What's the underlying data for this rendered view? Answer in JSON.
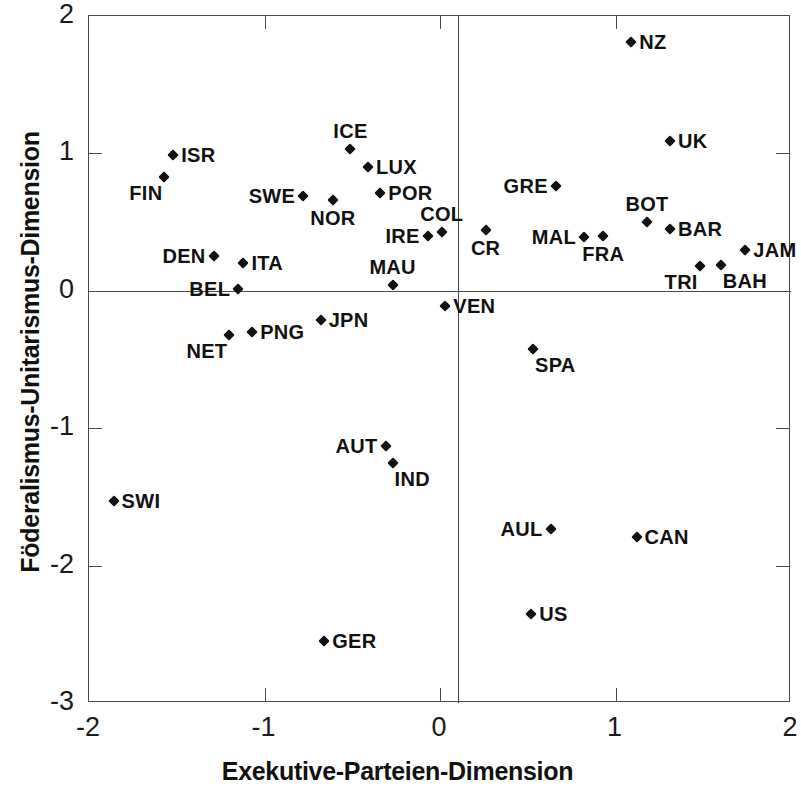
{
  "chart_data": {
    "type": "scatter",
    "title": "",
    "xlabel": "Exekutive-Parteien-Dimension",
    "ylabel": "Föderalismus-Unitarismus-Dimension",
    "xlim": [
      -2,
      2
    ],
    "ylim": [
      -3,
      2
    ],
    "xticks": [
      "-2",
      "-1",
      "0",
      "1",
      "2"
    ],
    "yticks": [
      "2",
      "1",
      "0",
      "-1",
      "-2",
      "-3"
    ],
    "grid": false,
    "legend": "none",
    "axes_through_origin": true,
    "marker": "diamond",
    "marker_color": "#111111",
    "points": [
      {
        "label": "NZ",
        "x": 1.09,
        "y": 1.81,
        "pos": "lab-r"
      },
      {
        "label": "ICE",
        "x": -0.51,
        "y": 1.03,
        "pos": "lab-t"
      },
      {
        "label": "UK",
        "x": 1.31,
        "y": 1.09,
        "pos": "lab-r"
      },
      {
        "label": "ISR",
        "x": -1.52,
        "y": 0.99,
        "pos": "lab-r"
      },
      {
        "label": "LUX",
        "x": -0.41,
        "y": 0.9,
        "pos": "lab-r"
      },
      {
        "label": "FIN",
        "x": -1.57,
        "y": 0.83,
        "pos": "lab-bl"
      },
      {
        "label": "GRE",
        "x": 0.66,
        "y": 0.76,
        "pos": "lab-l"
      },
      {
        "label": "POR",
        "x": -0.34,
        "y": 0.71,
        "pos": "lab-r"
      },
      {
        "label": "SWE",
        "x": -0.78,
        "y": 0.69,
        "pos": "lab-l"
      },
      {
        "label": "NOR",
        "x": -0.61,
        "y": 0.66,
        "pos": "lab-b"
      },
      {
        "label": "BOT",
        "x": 1.18,
        "y": 0.5,
        "pos": "lab-t"
      },
      {
        "label": "BAR",
        "x": 1.31,
        "y": 0.45,
        "pos": "lab-r"
      },
      {
        "label": "MAL",
        "x": 0.82,
        "y": 0.39,
        "pos": "lab-l"
      },
      {
        "label": "COL",
        "x": 0.01,
        "y": 0.43,
        "pos": "lab-t"
      },
      {
        "label": "CR",
        "x": 0.26,
        "y": 0.44,
        "pos": "lab-b"
      },
      {
        "label": "IRE",
        "x": -0.07,
        "y": 0.4,
        "pos": "lab-l"
      },
      {
        "label": "FRA",
        "x": 0.93,
        "y": 0.4,
        "pos": "lab-b"
      },
      {
        "label": "JAM",
        "x": 1.74,
        "y": 0.3,
        "pos": "lab-r"
      },
      {
        "label": "DEN",
        "x": -1.29,
        "y": 0.25,
        "pos": "lab-l"
      },
      {
        "label": "ITA",
        "x": -1.12,
        "y": 0.2,
        "pos": "lab-r"
      },
      {
        "label": "TRI",
        "x": 1.48,
        "y": 0.18,
        "pos": "lab-bl"
      },
      {
        "label": "BAH",
        "x": 1.6,
        "y": 0.19,
        "pos": "lab-br"
      },
      {
        "label": "MAU",
        "x": -0.27,
        "y": 0.04,
        "pos": "lab-t"
      },
      {
        "label": "BEL",
        "x": -1.15,
        "y": 0.01,
        "pos": "lab-l"
      },
      {
        "label": "VEN",
        "x": 0.03,
        "y": -0.11,
        "pos": "lab-r"
      },
      {
        "label": "JPN",
        "x": -0.68,
        "y": -0.21,
        "pos": "lab-r"
      },
      {
        "label": "PNG",
        "x": -1.07,
        "y": -0.3,
        "pos": "lab-r"
      },
      {
        "label": "NET",
        "x": -1.2,
        "y": -0.32,
        "pos": "lab-bl"
      },
      {
        "label": "SPA",
        "x": 0.53,
        "y": -0.42,
        "pos": "lab-br"
      },
      {
        "label": "AUT",
        "x": -0.31,
        "y": -1.13,
        "pos": "lab-l"
      },
      {
        "label": "IND",
        "x": -0.27,
        "y": -1.25,
        "pos": "lab-br"
      },
      {
        "label": "SWI",
        "x": -1.86,
        "y": -1.53,
        "pos": "lab-r"
      },
      {
        "label": "AUL",
        "x": 0.63,
        "y": -1.73,
        "pos": "lab-l"
      },
      {
        "label": "CAN",
        "x": 1.12,
        "y": -1.79,
        "pos": "lab-r"
      },
      {
        "label": "US",
        "x": 0.52,
        "y": -2.35,
        "pos": "lab-r"
      },
      {
        "label": "GER",
        "x": -0.66,
        "y": -2.55,
        "pos": "lab-r"
      }
    ]
  }
}
